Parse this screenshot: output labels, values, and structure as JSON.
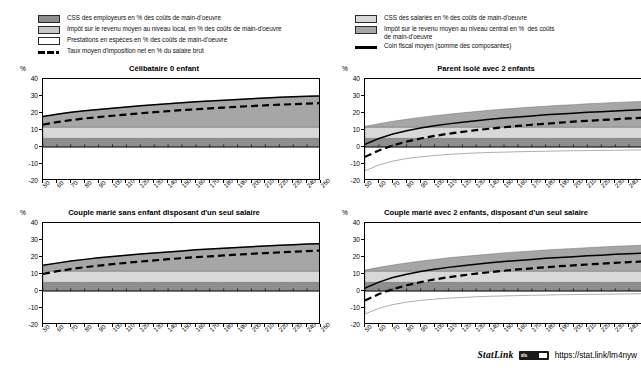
{
  "legend": {
    "left_items": [
      {
        "type": "swatch",
        "color": "#8e8e8e",
        "name": "employer-ssc",
        "label": "CSS des employeurs en % des coûts de main-d'oeuvre"
      },
      {
        "type": "swatch",
        "color": "#c9c9c9",
        "name": "local-income-tax",
        "label": "Impôt sur le revenu moyen au niveau local, en % des coûts de main-d'oeuvre"
      },
      {
        "type": "swatch",
        "color": "#ffffff",
        "name": "cash-benefits",
        "label": "Prestations en espèces en % des coûts de main-d'oeuvre"
      },
      {
        "type": "dashed",
        "color": "#000000",
        "name": "net-average-tax-rate",
        "label": "Taux moyen d'imposition net en % du salaire brut"
      }
    ],
    "right_items": [
      {
        "type": "swatch",
        "color": "#d8d8d8",
        "name": "employee-ssc",
        "label": "CSS des salariés en % des coûts de main-d'oeuvre"
      },
      {
        "type": "swatch",
        "color": "#a6a6a6",
        "name": "central-income-tax",
        "label": "Impôt sur le revenu moyen au niveau central en %  des coûts\nde main-d'oeuvre"
      },
      {
        "type": "solid",
        "color": "#000000",
        "name": "average-tax-wedge",
        "label": "Coin fiscal moyen (somme des composantes)"
      }
    ]
  },
  "axis_unit_label": "%",
  "statlink": {
    "word": "StatLink",
    "badge_text": "xls",
    "url": "https://stat.link/lm4nyw"
  },
  "chart_data": {
    "type": "area",
    "x": [
      50,
      60,
      70,
      80,
      90,
      100,
      110,
      120,
      130,
      140,
      150,
      160,
      170,
      180,
      190,
      200,
      210,
      220,
      230,
      240,
      250
    ],
    "xlabel": "",
    "ylabel": "%",
    "ylim": [
      -20,
      40
    ],
    "yticks": [
      -20,
      -10,
      0,
      10,
      20,
      30,
      40
    ],
    "grid": false,
    "legend_position": "top",
    "panels": [
      {
        "title": "Célibataire 0 enfant",
        "series": [
          {
            "name": "CSS des employeurs en % des coûts de main-d'oeuvre",
            "key": "employer_ssc",
            "color": "#8e8e8e",
            "values": [
              5.1,
              5.1,
              5.1,
              5.1,
              5.1,
              5.1,
              5.1,
              5.1,
              5.1,
              5.1,
              5.1,
              5.1,
              5.1,
              5.1,
              5.1,
              5.1,
              5.1,
              5.1,
              5.1,
              5.1,
              5.1
            ]
          },
          {
            "name": "CSS des salariés en % des coûts de main-d'oeuvre",
            "key": "employee_ssc",
            "color": "#d8d8d8",
            "values": [
              6.6,
              6.6,
              6.6,
              6.6,
              6.6,
              6.6,
              6.6,
              6.6,
              6.6,
              6.6,
              6.6,
              6.6,
              6.6,
              6.6,
              6.6,
              6.6,
              6.6,
              6.6,
              6.6,
              6.6,
              6.6
            ]
          },
          {
            "name": "Impôt sur le revenu moyen au niveau central en %  des coûts de main-d'oeuvre",
            "key": "central_income_tax",
            "color": "#a6a6a6",
            "values": [
              6.3,
              7.6,
              8.7,
              9.6,
              10.4,
              11.1,
              11.8,
              12.5,
              13.2,
              13.8,
              14.4,
              14.9,
              15.4,
              15.8,
              16.3,
              16.7,
              17.1,
              17.5,
              17.8,
              18.1,
              18.4
            ]
          },
          {
            "name": "Impôt sur le revenu moyen au niveau local, en % des coûts de main-d'oeuvre",
            "key": "local_income_tax",
            "color": "#c9c9c9",
            "values": [
              0,
              0,
              0,
              0,
              0,
              0,
              0,
              0,
              0,
              0,
              0,
              0,
              0,
              0,
              0,
              0,
              0,
              0,
              0,
              0,
              0
            ]
          },
          {
            "name": "Prestations en espèces en % des coûts de main-d'oeuvre",
            "key": "cash_benefits",
            "color": "#ffffff",
            "values": [
              0,
              0,
              0,
              0,
              0,
              0,
              0,
              0,
              0,
              0,
              0,
              0,
              0,
              0,
              0,
              0,
              0,
              0,
              0,
              0,
              0
            ]
          }
        ],
        "lines": [
          {
            "name": "Coin fiscal moyen (somme des composantes)",
            "key": "tax_wedge",
            "style": "solid",
            "color": "#000000",
            "values": [
              18.0,
              19.3,
              20.4,
              21.3,
              22.1,
              22.8,
              23.5,
              24.2,
              24.9,
              25.5,
              26.1,
              26.6,
              27.1,
              27.5,
              28.0,
              28.4,
              28.8,
              29.2,
              29.5,
              29.8,
              30.1
            ]
          },
          {
            "name": "Taux moyen d'imposition net en % du salaire brut",
            "key": "net_rate",
            "style": "dashed",
            "color": "#000000",
            "values": [
              13.2,
              14.6,
              15.8,
              16.8,
              17.6,
              18.4,
              19.1,
              19.8,
              20.5,
              21.1,
              21.7,
              22.2,
              22.7,
              23.2,
              23.7,
              24.1,
              24.5,
              24.9,
              25.2,
              25.5,
              25.8
            ]
          }
        ]
      },
      {
        "title": "Parent isolé avec 2 enfants",
        "series": [
          {
            "name": "CSS des employeurs en % des coûts de main-d'oeuvre",
            "key": "employer_ssc",
            "color": "#8e8e8e",
            "values": [
              5.1,
              5.1,
              5.1,
              5.1,
              5.1,
              5.1,
              5.1,
              5.1,
              5.1,
              5.1,
              5.1,
              5.1,
              5.1,
              5.1,
              5.1,
              5.1,
              5.1,
              5.1,
              5.1,
              5.1,
              5.1
            ]
          },
          {
            "name": "CSS des salariés en % des coûts de main-d'oeuvre",
            "key": "employee_ssc",
            "color": "#d8d8d8",
            "values": [
              6.6,
              6.6,
              6.6,
              6.6,
              6.6,
              6.6,
              6.6,
              6.6,
              6.6,
              6.6,
              6.6,
              6.6,
              6.6,
              6.6,
              6.6,
              6.6,
              6.6,
              6.6,
              6.6,
              6.6,
              6.6
            ]
          },
          {
            "name": "Impôt sur le revenu moyen au niveau central en %  des coûts de main-d'oeuvre",
            "key": "central_income_tax",
            "color": "#a6a6a6",
            "values": [
              0.5,
              2.0,
              3.4,
              4.6,
              5.7,
              6.7,
              7.6,
              8.4,
              9.2,
              9.9,
              10.6,
              11.2,
              11.8,
              12.3,
              12.8,
              13.2,
              13.7,
              14.1,
              14.5,
              14.8,
              15.1
            ]
          },
          {
            "name": "Impôt sur le revenu moyen au niveau local, en % des coûts de main-d'oeuvre",
            "key": "local_income_tax",
            "color": "#c9c9c9",
            "values": [
              0,
              0,
              0,
              0,
              0,
              0,
              0,
              0,
              0,
              0,
              0,
              0,
              0,
              0,
              0,
              0,
              0,
              0,
              0,
              0,
              0
            ]
          },
          {
            "name": "Prestations en espèces en % des coûts de main-d'oeuvre",
            "key": "cash_benefits",
            "color": "#ffffff",
            "values": [
              -14.0,
              -10.6,
              -8.3,
              -6.8,
              -5.8,
              -5.0,
              -4.4,
              -3.9,
              -3.5,
              -3.2,
              -3.0,
              -2.8,
              -2.6,
              -2.5,
              -2.3,
              -2.2,
              -2.1,
              -2.0,
              -1.9,
              -1.8,
              -1.7
            ]
          }
        ],
        "lines": [
          {
            "name": "Coin fiscal moyen (somme des composantes)",
            "key": "tax_wedge",
            "style": "solid",
            "color": "#000000",
            "values": [
              1.6,
              5.0,
              7.6,
              9.6,
              11.2,
              12.5,
              13.6,
              14.6,
              15.5,
              16.3,
              17.0,
              17.7,
              18.3,
              18.9,
              19.4,
              19.9,
              20.4,
              20.8,
              21.2,
              21.6,
              22.0
            ]
          },
          {
            "name": "Taux moyen d'imposition net en % du salaire brut",
            "key": "net_rate",
            "style": "dashed",
            "color": "#000000",
            "values": [
              -5.8,
              -2.0,
              0.9,
              3.2,
              5.0,
              6.5,
              7.8,
              8.9,
              9.9,
              10.8,
              11.6,
              12.4,
              13.1,
              13.7,
              14.3,
              14.9,
              15.4,
              15.9,
              16.3,
              16.8,
              17.2
            ]
          }
        ]
      },
      {
        "title": "Couple marié sans enfant disposant d'un seul salaire",
        "series": [
          {
            "name": "CSS des employeurs en % des coûts de main-d'oeuvre",
            "key": "employer_ssc",
            "color": "#8e8e8e",
            "values": [
              5.1,
              5.1,
              5.1,
              5.1,
              5.1,
              5.1,
              5.1,
              5.1,
              5.1,
              5.1,
              5.1,
              5.1,
              5.1,
              5.1,
              5.1,
              5.1,
              5.1,
              5.1,
              5.1,
              5.1,
              5.1
            ]
          },
          {
            "name": "CSS des salariés en % des coûts de main-d'oeuvre",
            "key": "employee_ssc",
            "color": "#d8d8d8",
            "values": [
              6.6,
              6.6,
              6.6,
              6.6,
              6.6,
              6.6,
              6.6,
              6.6,
              6.6,
              6.6,
              6.6,
              6.6,
              6.6,
              6.6,
              6.6,
              6.6,
              6.6,
              6.6,
              6.6,
              6.6,
              6.6
            ]
          },
          {
            "name": "Impôt sur le revenu moyen au niveau central en %  des coûts de main-d'oeuvre",
            "key": "central_income_tax",
            "color": "#a6a6a6",
            "values": [
              3.4,
              4.7,
              5.9,
              6.9,
              7.8,
              8.6,
              9.3,
              10.0,
              10.7,
              11.3,
              11.9,
              12.5,
              13.0,
              13.5,
              13.9,
              14.4,
              14.8,
              15.2,
              15.5,
              15.9,
              16.2
            ]
          },
          {
            "name": "Impôt sur le revenu moyen au niveau local, en % des coûts de main-d'oeuvre",
            "key": "local_income_tax",
            "color": "#c9c9c9",
            "values": [
              0,
              0,
              0,
              0,
              0,
              0,
              0,
              0,
              0,
              0,
              0,
              0,
              0,
              0,
              0,
              0,
              0,
              0,
              0,
              0,
              0
            ]
          },
          {
            "name": "Prestations en espèces en % des coûts de main-d'oeuvre",
            "key": "cash_benefits",
            "color": "#ffffff",
            "values": [
              0,
              0,
              0,
              0,
              0,
              0,
              0,
              0,
              0,
              0,
              0,
              0,
              0,
              0,
              0,
              0,
              0,
              0,
              0,
              0,
              0
            ]
          }
        ],
        "lines": [
          {
            "name": "Coin fiscal moyen (somme des composantes)",
            "key": "tax_wedge",
            "style": "solid",
            "color": "#000000",
            "values": [
              15.1,
              16.4,
              17.6,
              18.6,
              19.5,
              20.3,
              21.0,
              21.7,
              22.4,
              23.0,
              23.6,
              24.2,
              24.7,
              25.2,
              25.6,
              26.1,
              26.5,
              26.9,
              27.2,
              27.6,
              27.9
            ]
          },
          {
            "name": "Taux moyen d'imposition net en % du salaire brut",
            "key": "net_rate",
            "style": "dashed",
            "color": "#000000",
            "values": [
              10.1,
              11.6,
              12.9,
              14.0,
              14.9,
              15.8,
              16.6,
              17.3,
              18.0,
              18.7,
              19.3,
              19.9,
              20.4,
              20.9,
              21.4,
              21.9,
              22.3,
              22.7,
              23.1,
              23.5,
              23.8
            ]
          }
        ]
      },
      {
        "title": "Couple marié avec 2 enfants, disposant d'un seul salaire",
        "series": [
          {
            "name": "CSS des employeurs en % des coûts de main-d'oeuvre",
            "key": "employer_ssc",
            "color": "#8e8e8e",
            "values": [
              5.1,
              5.1,
              5.1,
              5.1,
              5.1,
              5.1,
              5.1,
              5.1,
              5.1,
              5.1,
              5.1,
              5.1,
              5.1,
              5.1,
              5.1,
              5.1,
              5.1,
              5.1,
              5.1,
              5.1,
              5.1
            ]
          },
          {
            "name": "CSS des salariés en % des coûts de main-d'oeuvre",
            "key": "employee_ssc",
            "color": "#d8d8d8",
            "values": [
              6.6,
              6.6,
              6.6,
              6.6,
              6.6,
              6.6,
              6.6,
              6.6,
              6.6,
              6.6,
              6.6,
              6.6,
              6.6,
              6.6,
              6.6,
              6.6,
              6.6,
              6.6,
              6.6,
              6.6,
              6.6
            ]
          },
          {
            "name": "Impôt sur le revenu moyen au niveau central en %  des coûts de main-d'oeuvre",
            "key": "central_income_tax",
            "color": "#a6a6a6",
            "values": [
              0.6,
              2.2,
              3.6,
              4.8,
              5.9,
              6.9,
              7.8,
              8.6,
              9.3,
              10.0,
              10.7,
              11.3,
              11.8,
              12.4,
              12.9,
              13.3,
              13.8,
              14.2,
              14.6,
              14.9,
              15.3
            ]
          },
          {
            "name": "Impôt sur le revenu moyen au niveau local, en % des coûts de main-d'oeuvre",
            "key": "local_income_tax",
            "color": "#c9c9c9",
            "values": [
              0,
              0,
              0,
              0,
              0,
              0,
              0,
              0,
              0,
              0,
              0,
              0,
              0,
              0,
              0,
              0,
              0,
              0,
              0,
              0,
              0
            ]
          },
          {
            "name": "Prestations en espèces en % des coûts de main-d'oeuvre",
            "key": "cash_benefits",
            "color": "#ffffff",
            "values": [
              -13.5,
              -10.2,
              -8.0,
              -6.5,
              -5.5,
              -4.8,
              -4.2,
              -3.8,
              -3.4,
              -3.1,
              -2.9,
              -2.7,
              -2.5,
              -2.4,
              -2.2,
              -2.1,
              -2.0,
              -1.9,
              -1.8,
              -1.7,
              -1.6
            ]
          }
        ],
        "lines": [
          {
            "name": "Coin fiscal moyen (somme des composantes)",
            "key": "tax_wedge",
            "style": "solid",
            "color": "#000000",
            "values": [
              1.7,
              5.2,
              7.9,
              9.9,
              11.5,
              12.8,
              13.9,
              14.9,
              15.8,
              16.6,
              17.3,
              18.0,
              18.6,
              19.2,
              19.7,
              20.2,
              20.7,
              21.1,
              21.6,
              21.9,
              22.3
            ]
          },
          {
            "name": "Taux moyen d'imposition net en % du salaire brut",
            "key": "net_rate",
            "style": "dashed",
            "color": "#000000",
            "values": [
              -5.6,
              -1.8,
              1.1,
              3.4,
              5.2,
              6.8,
              8.1,
              9.2,
              10.2,
              11.1,
              11.9,
              12.7,
              13.3,
              14.0,
              14.6,
              15.1,
              15.6,
              16.1,
              16.6,
              17.0,
              17.4
            ]
          }
        ]
      }
    ]
  }
}
